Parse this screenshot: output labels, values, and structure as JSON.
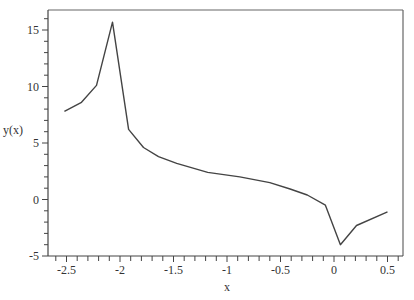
{
  "chart_data": {
    "type": "line",
    "title": "",
    "xlabel": "x",
    "ylabel": "y(x)",
    "xlim": [
      -2.65,
      0.65
    ],
    "ylim": [
      -5,
      16.8
    ],
    "grid": false,
    "legend": null,
    "xticks": [
      -2.5,
      -2,
      -1.5,
      -1,
      -0.5,
      0,
      0.5
    ],
    "xtick_labels": [
      "-2.5",
      "-2",
      "-1.5",
      "-1",
      "-0.5",
      "0",
      "0.5"
    ],
    "yticks": [
      -5,
      0,
      5,
      10,
      15
    ],
    "ytick_labels": [
      "-5",
      "0",
      "5",
      "10",
      "15"
    ],
    "line_color": "#444444",
    "series": [
      {
        "name": "y(x)",
        "x": [
          -2.52,
          -2.36,
          -2.22,
          -2.07,
          -1.92,
          -1.78,
          -1.64,
          -1.47,
          -1.18,
          -0.88,
          -0.6,
          -0.41,
          -0.25,
          -0.08,
          0.06,
          0.21,
          0.5
        ],
        "y": [
          7.8,
          8.6,
          10.1,
          15.7,
          6.2,
          4.6,
          3.8,
          3.2,
          2.4,
          2.0,
          1.5,
          0.93,
          0.4,
          -0.5,
          -4.0,
          -2.3,
          -1.1
        ]
      }
    ]
  }
}
